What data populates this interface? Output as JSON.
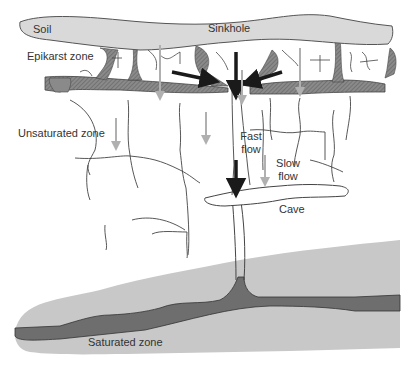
{
  "diagram": {
    "labels": {
      "soil": "Soil",
      "sinkhole": "Sinkhole",
      "epikarst": "Epikarst zone",
      "unsaturated": "Unsaturated zone",
      "fast_flow_1": "Fast",
      "fast_flow_2": "flow",
      "slow_flow_1": "Slow",
      "slow_flow_2": "flow",
      "cave": "Cave",
      "saturated": "Saturated zone"
    },
    "colors": {
      "soil_fill": "#d9d9d9",
      "epikarst_fill": "#8a8a8a",
      "saturated_fill": "#c8c8c8",
      "conduit_fill": "#6e6e6e",
      "fast_arrow": "#1a1a1a",
      "slow_arrow": "#b0b0b0",
      "line": "#444444"
    }
  }
}
